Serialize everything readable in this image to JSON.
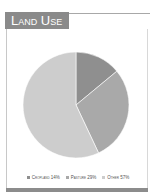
{
  "title": "Land Use",
  "chart_data": {
    "type": "pie",
    "title": "Land Use",
    "categories": [
      "Cropland",
      "Pasture",
      "Other"
    ],
    "values": [
      14,
      29,
      57
    ],
    "labels": [
      "Cropland 14%",
      "Pasture 29%",
      "Other 57%"
    ],
    "colors": [
      "#8f8f8f",
      "#a9a9a9",
      "#cdcdcd"
    ],
    "start_angle": "12 o'clock, clockwise",
    "legend_position": "bottom"
  },
  "legend": [
    {
      "label": "Cropland 14%",
      "color": "#8f8f8f"
    },
    {
      "label": "Pasture 29%",
      "color": "#a9a9a9"
    },
    {
      "label": "Other 57%",
      "color": "#cdcdcd"
    }
  ]
}
